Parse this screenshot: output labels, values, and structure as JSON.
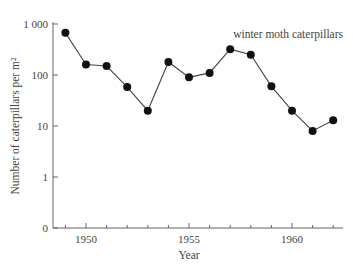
{
  "chart_data": {
    "type": "line",
    "title": "",
    "series_label": "winter moth caterpillars",
    "xlabel": "Year",
    "ylabel": "Number of caterpillars per m²",
    "yscale": "log",
    "ylim": [
      0,
      1000
    ],
    "xlim": [
      1948.4,
      1962.5
    ],
    "grid": false,
    "legend_position": "top-right",
    "x_ticks": [
      1950,
      1955,
      1960
    ],
    "x_tick_labels": [
      "1950",
      "1955",
      "1960"
    ],
    "x_minor_ticks": [
      1949,
      1951,
      1952,
      1953,
      1954,
      1956,
      1957,
      1958,
      1959,
      1961,
      1962
    ],
    "y_ticks": [
      0,
      1,
      10,
      100,
      1000
    ],
    "y_tick_labels": [
      "0",
      "1",
      "10",
      "100",
      "1 000"
    ],
    "x": [
      1949,
      1950,
      1951,
      1952,
      1953,
      1954,
      1955,
      1956,
      1957,
      1958,
      1959,
      1960,
      1961,
      1962
    ],
    "series": [
      {
        "name": "winter moth caterpillars",
        "values": [
          670,
          160,
          150,
          58,
          20,
          180,
          90,
          110,
          320,
          250,
          60,
          20,
          8,
          13
        ]
      }
    ],
    "colors": {
      "line": "#444444",
      "marker": "#111111",
      "axis": "#666666"
    }
  }
}
